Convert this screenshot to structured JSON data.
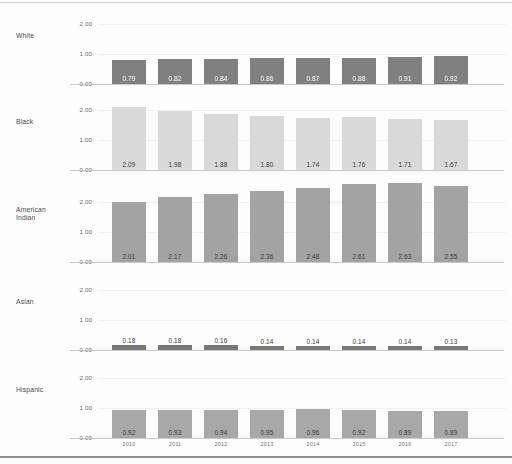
{
  "chart_data": {
    "type": "bar",
    "title": "",
    "subtitle": "",
    "xlabel": "",
    "ylabel": "",
    "ylim": [
      0,
      2.8
    ],
    "yticks": [
      "0.00",
      "1.00",
      "2.00"
    ],
    "ytick_values": [
      0,
      1,
      2
    ],
    "grid": true,
    "legend": "none",
    "layout": "small-multiples-rows",
    "categories": [
      "2010",
      "2011",
      "2012",
      "2013",
      "2014",
      "2015",
      "2016",
      "2017"
    ],
    "series": [
      {
        "name": "White",
        "color": "#808080",
        "label_color": "#ffffff",
        "values": [
          0.79,
          0.82,
          0.84,
          0.86,
          0.87,
          0.88,
          0.91,
          0.92
        ],
        "value_labels": [
          "0.79",
          "0.82",
          "0.84",
          "0.86",
          "0.87",
          "0.88",
          "0.91",
          "0.92"
        ]
      },
      {
        "name": "Black",
        "color": "#d9d9d9",
        "label_color": "#3a3a3a",
        "values": [
          2.09,
          1.98,
          1.88,
          1.8,
          1.74,
          1.76,
          1.71,
          1.67
        ],
        "value_labels": [
          "2.09",
          "1.98",
          "1.88",
          "1.80",
          "1.74",
          "1.76",
          "1.71",
          "1.67"
        ]
      },
      {
        "name": "American\nIndian",
        "color": "#a3a3a3",
        "label_color": "#3a3a3a",
        "values": [
          2.01,
          2.17,
          2.26,
          2.36,
          2.48,
          2.61,
          2.63,
          2.55
        ],
        "value_labels": [
          "2.01",
          "2.17",
          "2.26",
          "2.36",
          "2.48",
          "2.61",
          "2.63",
          "2.55"
        ]
      },
      {
        "name": "Asian",
        "color": "#787878",
        "label_color": "#3a3a3a",
        "values": [
          0.18,
          0.18,
          0.16,
          0.14,
          0.14,
          0.14,
          0.14,
          0.13
        ],
        "value_labels": [
          "0.18",
          "0.18",
          "0.16",
          "0.14",
          "0.14",
          "0.14",
          "0.14",
          "0.13"
        ]
      },
      {
        "name": "Hispanic",
        "color": "#a8a8a8",
        "label_color": "#3a3a3a",
        "values": [
          0.92,
          0.93,
          0.94,
          0.95,
          0.96,
          0.92,
          0.89,
          0.89
        ],
        "value_labels": [
          "0.92",
          "0.93",
          "0.94",
          "0.95",
          "0.96",
          "0.92",
          "0.89",
          "0.89"
        ]
      }
    ]
  },
  "panels": {
    "white": {
      "label": "White"
    },
    "black": {
      "label": "Black"
    },
    "american_indian": {
      "label": "American\nIndian"
    },
    "asian": {
      "label": "Asian"
    },
    "hispanic": {
      "label": "Hispanic"
    }
  },
  "axis": {
    "tick_top": "2.00",
    "tick_mid": "1.00",
    "tick_bottom": "0.00"
  }
}
